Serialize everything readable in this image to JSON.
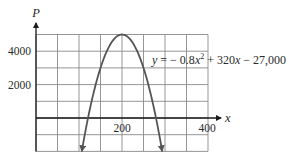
{
  "chart_data": {
    "type": "line",
    "title": "",
    "equation_label": "y = − 0.8x² + 320x − 27,000",
    "equation_parts": {
      "lhs": "y",
      "eq": " = − 0.8",
      "var1": "x",
      "exp": "2",
      "mid": " + 320",
      "var2": "x",
      "tail": " − 27,000"
    },
    "xlabel": "x",
    "ylabel": "P",
    "x_ticks": [
      200,
      400
    ],
    "x_tick_labels": [
      "200",
      "400"
    ],
    "y_ticks": [
      2000,
      4000
    ],
    "y_tick_labels": [
      "2000",
      "4000"
    ],
    "xlim": [
      0,
      400
    ],
    "ylim": [
      -2000,
      5000
    ],
    "grid": true,
    "grid_x_step": 50,
    "grid_y_step": 1000,
    "series": [
      {
        "name": "P = -0.8x^2 + 320x - 27000",
        "function": {
          "a": -0.8,
          "b": 320,
          "c": -27000
        },
        "x": [
          106.5,
          121,
          150,
          175,
          200,
          225,
          250,
          279,
          293.5
        ],
        "values": [
          -2000,
          0,
          3000,
          4500,
          5000,
          4500,
          3000,
          0,
          -2000
        ]
      }
    ],
    "vertex": {
      "x": 200,
      "y": 5000
    },
    "roots": [
      121,
      279
    ],
    "arrows_on_ends": true,
    "legend": null
  },
  "colors": {
    "grid": "#8a8a8a",
    "axis": "#1a1a1a",
    "curve": "#555555",
    "text": "#2a2a2a"
  }
}
